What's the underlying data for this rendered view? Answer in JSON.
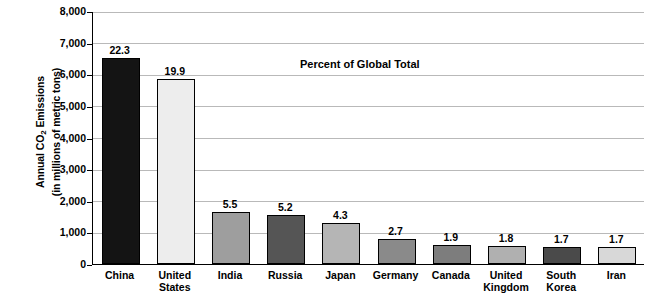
{
  "chart_data": {
    "type": "bar",
    "title": "",
    "annotation": "Percent of Global Total",
    "ylabel_line1": "Annual CO",
    "ylabel_sub": "2",
    "ylabel_line1_end": " Emissions",
    "ylabel_line2": "(in millions of metric tons)",
    "xlabel": "",
    "ylim": [
      0,
      8000
    ],
    "ytick_labels": [
      "0",
      "1,000",
      "2,000",
      "3,000",
      "4,000",
      "5,000",
      "6,000",
      "7,000",
      "8,000"
    ],
    "ytick_values": [
      0,
      1000,
      2000,
      3000,
      4000,
      5000,
      6000,
      7000,
      8000
    ],
    "grid": true,
    "legend": "none",
    "categories": [
      "China",
      "United\nStates",
      "India",
      "Russia",
      "Japan",
      "Germany",
      "Canada",
      "United\nKingdom",
      "South\nKorea",
      "Iran"
    ],
    "values": [
      6520,
      5840,
      1660,
      1560,
      1290,
      800,
      610,
      580,
      530,
      530
    ],
    "data_labels": [
      "22.3",
      "19.9",
      "5.5",
      "5.2",
      "4.3",
      "2.7",
      "1.9",
      "1.8",
      "1.7",
      "1.7"
    ],
    "bar_colors": [
      "#141414",
      "#ededed",
      "#9e9e9e",
      "#555555",
      "#b5b5b5",
      "#8a8a8a",
      "#7d7d7d",
      "#b0b0b0",
      "#4a4a4a",
      "#d8d8d8"
    ],
    "bar_label_is_percent": true
  }
}
